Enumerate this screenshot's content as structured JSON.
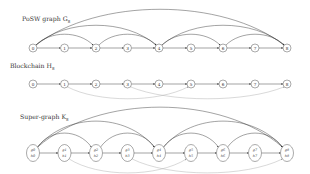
{
  "panels": [
    {
      "id": "posw",
      "title": "PoSW graph G",
      "title_sub": "8",
      "nodes": [
        "0",
        "1",
        "2",
        "3",
        "4",
        "5",
        "6",
        "7",
        "8"
      ],
      "chain_edges": [
        [
          0,
          1
        ],
        [
          1,
          2
        ],
        [
          2,
          3
        ],
        [
          3,
          4
        ],
        [
          4,
          5
        ],
        [
          5,
          6
        ],
        [
          6,
          7
        ],
        [
          7,
          8
        ]
      ],
      "arc_edges_above": [
        [
          0,
          2
        ],
        [
          0,
          4
        ],
        [
          0,
          8
        ],
        [
          2,
          4
        ],
        [
          4,
          6
        ],
        [
          4,
          8
        ],
        [
          6,
          8
        ]
      ],
      "arc_edges_below": []
    },
    {
      "id": "blockchain",
      "title": "Blockchain H",
      "title_sub": "8",
      "nodes": [
        "0",
        "1",
        "2",
        "3",
        "4",
        "5",
        "6",
        "7",
        "8"
      ],
      "chain_edges": [
        [
          0,
          1
        ],
        [
          1,
          2
        ],
        [
          2,
          3
        ],
        [
          3,
          4
        ],
        [
          4,
          5
        ],
        [
          5,
          6
        ],
        [
          6,
          7
        ],
        [
          7,
          8
        ]
      ],
      "arc_edges_above": [],
      "arc_edges_below": [
        [
          1,
          5
        ],
        [
          3,
          8
        ]
      ]
    },
    {
      "id": "supergraph",
      "title": "Super-graph K",
      "title_sub": "8",
      "nodes": [
        {
          "top": "g0",
          "bottom": "h0"
        },
        {
          "top": "g1",
          "bottom": "h1"
        },
        {
          "top": "g2",
          "bottom": "h2"
        },
        {
          "top": "g3",
          "bottom": "h3"
        },
        {
          "top": "g4",
          "bottom": "h4"
        },
        {
          "top": "g5",
          "bottom": "h5"
        },
        {
          "top": "g6",
          "bottom": "h6"
        },
        {
          "top": "g7",
          "bottom": "h7"
        },
        {
          "top": "g8",
          "bottom": "h8"
        }
      ],
      "chain_edges": [
        [
          0,
          1
        ],
        [
          1,
          2
        ],
        [
          2,
          3
        ],
        [
          3,
          4
        ],
        [
          4,
          5
        ],
        [
          5,
          6
        ],
        [
          6,
          7
        ],
        [
          7,
          8
        ]
      ],
      "arc_edges_above": [
        [
          0,
          2
        ],
        [
          0,
          4
        ],
        [
          0,
          8
        ],
        [
          2,
          4
        ],
        [
          4,
          6
        ],
        [
          4,
          8
        ],
        [
          6,
          8
        ]
      ],
      "arc_edges_below": [
        [
          1,
          5
        ],
        [
          3,
          8
        ]
      ]
    }
  ]
}
